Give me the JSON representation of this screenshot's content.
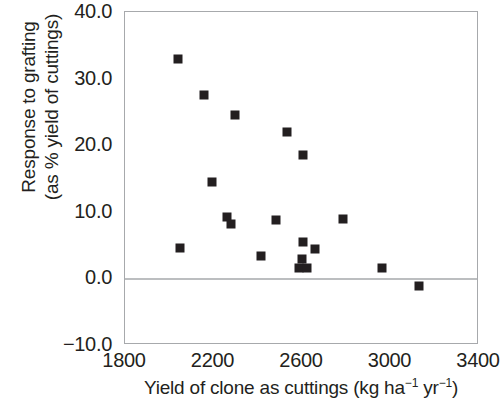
{
  "chart_data": {
    "type": "scatter",
    "title": "",
    "xlabel": "Yield of clone as cuttings (kg ha⁻¹ yr⁻¹)",
    "xlabel_parts": {
      "text_before": "Yield of clone as cuttings (kg ha",
      "sup1": "−1",
      "text_middle": " yr",
      "sup2": "−1",
      "text_after": ")"
    },
    "ylabel": "Response to grafting (as % yield of cuttings)",
    "ylabel_line1": "Response to grafting",
    "ylabel_line2": "(as % yield of cuttings)",
    "xlim": [
      1800,
      3400
    ],
    "ylim": [
      -10.0,
      40.0
    ],
    "xticks": [
      1800,
      2200,
      2600,
      3000,
      3400
    ],
    "xtick_labels": [
      "1800",
      "2200",
      "2600",
      "3000",
      "3400"
    ],
    "yticks": [
      -10.0,
      0.0,
      10.0,
      20.0,
      30.0,
      40.0
    ],
    "ytick_labels": [
      "−10.0",
      "0.0",
      "10.0",
      "20.0",
      "30.0",
      "40.0"
    ],
    "grid": false,
    "legend": null,
    "zero_line": 0.0,
    "marker": "square",
    "marker_color": "#231f20",
    "frame_color": "#a7a9ac",
    "zero_line_color": "#bcbec0",
    "points": [
      {
        "x": 2040,
        "y": 33.0
      },
      {
        "x": 2157,
        "y": 27.5
      },
      {
        "x": 2297,
        "y": 24.5
      },
      {
        "x": 2532,
        "y": 22.0
      },
      {
        "x": 2604,
        "y": 18.5
      },
      {
        "x": 2195,
        "y": 14.5
      },
      {
        "x": 2262,
        "y": 9.2
      },
      {
        "x": 2280,
        "y": 8.1
      },
      {
        "x": 2483,
        "y": 8.8
      },
      {
        "x": 2786,
        "y": 8.9
      },
      {
        "x": 2606,
        "y": 5.5
      },
      {
        "x": 2050,
        "y": 4.5
      },
      {
        "x": 2660,
        "y": 4.4
      },
      {
        "x": 2415,
        "y": 3.4
      },
      {
        "x": 2598,
        "y": 2.9
      },
      {
        "x": 2586,
        "y": 1.5
      },
      {
        "x": 2622,
        "y": 1.5
      },
      {
        "x": 2960,
        "y": 1.6
      },
      {
        "x": 3130,
        "y": -1.2
      }
    ]
  }
}
